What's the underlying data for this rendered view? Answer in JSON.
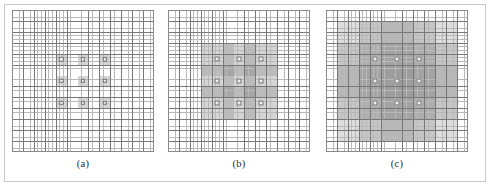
{
  "figure": {
    "panels": [
      {
        "id": "a",
        "label": "(a)",
        "grid": {
          "coarse_cells_x": 13,
          "coarse_cells_y": 13,
          "fine_per_coarse": 3
        },
        "support": {
          "description": "nine non-overlapping one-cell supports forming a 3x3 block",
          "region_span_coarse": 1,
          "overlap_levels": 1
        },
        "sample_points": {
          "rows": 3,
          "cols": 3,
          "count": 9
        }
      },
      {
        "id": "b",
        "label": "(b)",
        "grid": {
          "coarse_cells_x": 13,
          "coarse_cells_y": 13,
          "fine_per_coarse": 3
        },
        "support": {
          "description": "nine overlapping three-cell supports forming a 5x5 shaded block with a darker 3x3 core",
          "region_span_coarse": 3,
          "overlap_levels": 2
        },
        "sample_points": {
          "rows": 3,
          "cols": 3,
          "count": 9
        }
      },
      {
        "id": "c",
        "label": "(c)",
        "grid": {
          "coarse_cells_x": 13,
          "coarse_cells_y": 13,
          "fine_per_coarse": 3
        },
        "support": {
          "description": "nine widely overlapping seven-cell supports covering almost the whole grid with a darker central band",
          "region_span_coarse": 7,
          "overlap_levels": 3
        },
        "sample_points": {
          "rows": 3,
          "cols": 3,
          "count": 9
        }
      }
    ],
    "colors": {
      "page_background": "#ffffff",
      "outer_frame": "#c9c9c9",
      "fine_grid_line": "#b9b9b9",
      "coarse_grid_line": "#787878",
      "grid_border": "#8a8a8a",
      "shaded_region": "#9a9a9a",
      "sample_point_fill": "#efefef",
      "sample_point_stroke": "#6f6f6f",
      "label_text": "#2b2b2b"
    }
  }
}
